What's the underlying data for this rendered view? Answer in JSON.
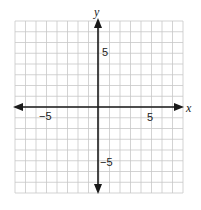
{
  "chart_data": {
    "type": "scatter",
    "title": "",
    "xlabel": "x",
    "ylabel": "y",
    "xlim": [
      -8,
      8
    ],
    "ylim": [
      -8,
      8
    ],
    "grid": true,
    "x_ticks_labeled": [
      -5,
      5
    ],
    "y_ticks_labeled": [
      5,
      -5
    ],
    "series": [],
    "x": [],
    "values": []
  },
  "labels": {
    "x_axis": "x",
    "y_axis": "y",
    "x_neg5": "−5",
    "x_pos5": "5",
    "y_pos5": "5",
    "y_neg5": "−5"
  },
  "colors": {
    "grid": "#c8c8c8",
    "axis": "#1a1a1a"
  }
}
